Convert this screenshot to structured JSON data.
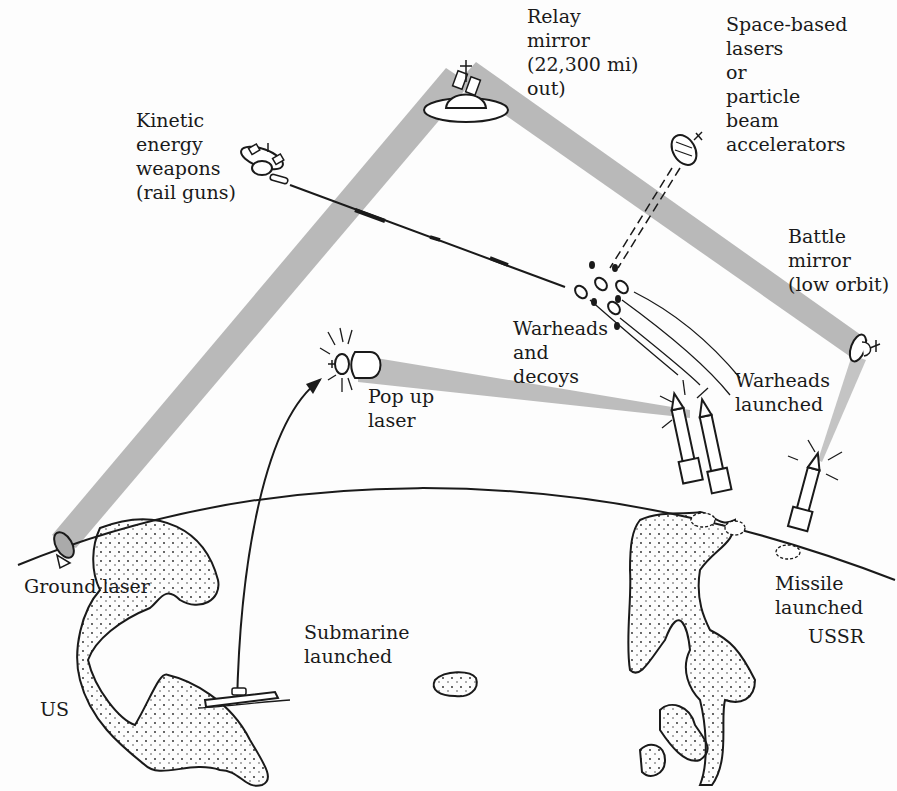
{
  "diagram": {
    "type": "Strategic Defense Initiative scenario illustration",
    "colors": {
      "beam": "#b9b9b9",
      "ink": "#1a1a1a",
      "background": "#fdfdfd"
    },
    "labels": {
      "relay_mirror": "Relay\nmirror\n(22,300 mi)\nout)",
      "space_lasers": "Space-based\nlasers\nor\nparticle\nbeam\naccelerators",
      "kinetic": "Kinetic\nenergy\nweapons\n(rail guns)",
      "battle_mirror": "Battle\nmirror\n(low orbit)",
      "warheads_decoys": "Warheads\nand\ndecoys",
      "warheads_launched": "Warheads\nlaunched",
      "pop_up_laser": "Pop up\nlaser",
      "ground_laser": "Ground laser",
      "submarine": "Submarine\nlaunched",
      "missile_launched": "Missile\nlaunched",
      "us": "US",
      "ussr": "USSR"
    },
    "components": [
      {
        "name": "Relay mirror",
        "orbit": "22,300 mi out"
      },
      {
        "name": "Space-based lasers or particle beam accelerators"
      },
      {
        "name": "Kinetic energy weapons",
        "alias": "rail guns"
      },
      {
        "name": "Battle mirror",
        "orbit": "low orbit"
      },
      {
        "name": "Pop up laser",
        "launched_from": "Submarine"
      },
      {
        "name": "Ground laser",
        "location": "US"
      },
      {
        "name": "Warheads and decoys"
      },
      {
        "name": "Missile launched",
        "location": "USSR"
      }
    ],
    "connections": [
      {
        "from": "Ground laser",
        "to": "Relay mirror",
        "type": "laser-beam"
      },
      {
        "from": "Relay mirror",
        "to": "Battle mirror",
        "type": "laser-beam"
      },
      {
        "from": "Battle mirror",
        "to": "Missile launched",
        "type": "laser-beam"
      },
      {
        "from": "Pop up laser",
        "to": "Warheads launched",
        "type": "laser-beam"
      },
      {
        "from": "Kinetic energy weapons",
        "to": "Warheads and decoys",
        "type": "projectile"
      },
      {
        "from": "Space-based lasers",
        "to": "Warheads and decoys",
        "type": "particle-beam"
      },
      {
        "from": "Submarine",
        "to": "Pop up laser",
        "type": "arrow"
      }
    ]
  }
}
